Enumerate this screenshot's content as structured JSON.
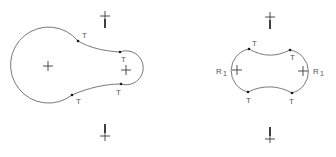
{
  "figures": [
    {
      "id": "asymmetric",
      "tangent_labels": [
        "T",
        "T",
        "T",
        "T"
      ],
      "radius_labels": []
    },
    {
      "id": "symmetric",
      "tangent_labels": [
        "T",
        "T",
        "T",
        "T"
      ],
      "radius_labels": [
        {
          "main": "R",
          "sub": "1"
        },
        {
          "main": "R",
          "sub": "1"
        }
      ]
    }
  ],
  "colors": {
    "outline": "#6a6a6a",
    "marks": "#2a2a2a",
    "background": "#ffffff"
  }
}
